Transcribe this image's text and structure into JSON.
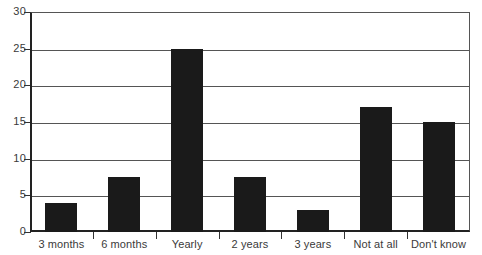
{
  "chart_data": {
    "type": "bar",
    "title": "",
    "subtitle": "",
    "xlabel": "",
    "ylabel": "",
    "categories": [
      "3 months",
      "6 months",
      "Yearly",
      "2 years",
      "3 years",
      "Not at all",
      "Don't know"
    ],
    "values": [
      4,
      7.5,
      25,
      7.5,
      3,
      17,
      15
    ],
    "ylim": [
      0,
      30
    ],
    "y_ticks": [
      0,
      5,
      10,
      15,
      20,
      25,
      30
    ],
    "y_tick_labels": [
      "0",
      "5",
      "10",
      "15",
      "20",
      "25",
      "30"
    ],
    "grid": true,
    "grid_axis": "y",
    "legend": false,
    "legend_position": "none",
    "annotations": [],
    "colors": {
      "bar": "#1a1a1a",
      "gridline": "#555555",
      "axis": "#222222",
      "text": "#3a3a3a",
      "background": "#ffffff"
    }
  }
}
